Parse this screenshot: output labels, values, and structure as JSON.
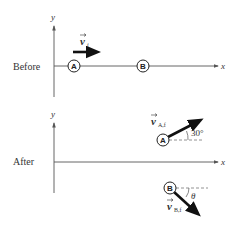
{
  "panels": [
    {
      "label": "Before",
      "axes": {
        "x_label": "x",
        "y_label": "y"
      },
      "objects": [
        {
          "name": "A",
          "label": "A"
        },
        {
          "name": "B",
          "label": "B"
        }
      ],
      "vectors": [
        {
          "name": "v_i",
          "symbol": "v",
          "subscript": "i"
        }
      ]
    },
    {
      "label": "After",
      "axes": {
        "x_label": "x",
        "y_label": "y"
      },
      "objects": [
        {
          "name": "A",
          "label": "A"
        },
        {
          "name": "B",
          "label": "B"
        }
      ],
      "vectors": [
        {
          "name": "v_A_f",
          "symbol": "v",
          "subscript": "A,f",
          "angle_label": "30°"
        },
        {
          "name": "v_B_f",
          "symbol": "v",
          "subscript": "B,f",
          "angle_label": "θ"
        }
      ]
    }
  ],
  "colors": {
    "axis": "#555555",
    "vector": "#111111",
    "dashed": "#777777",
    "text": "#333333"
  }
}
